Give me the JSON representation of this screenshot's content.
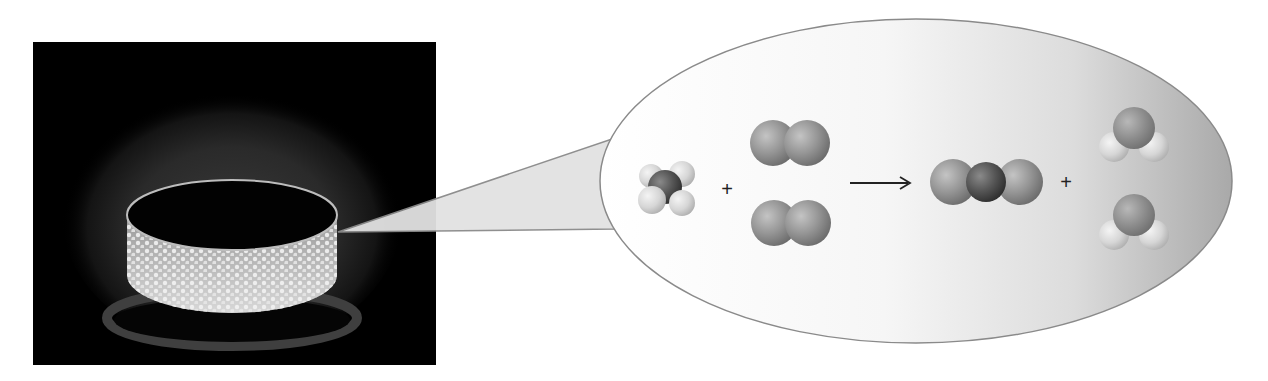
{
  "figure": {
    "photo": {
      "subject": "gas-stove-burner-flame",
      "background_color": "#000000"
    },
    "callout": {
      "fill_color": "#e2e2e2",
      "border_color": "#8a8a8a"
    },
    "reaction": {
      "reactants": [
        {
          "name": "methane",
          "formula": "CH4",
          "count": 1
        },
        {
          "name": "oxygen",
          "formula": "O2",
          "count": 2
        }
      ],
      "products": [
        {
          "name": "carbon-dioxide",
          "formula": "CO2",
          "count": 1
        },
        {
          "name": "water",
          "formula": "H2O",
          "count": 2
        }
      ],
      "plus_sign": "+",
      "arrow_symbol": "→"
    },
    "colors": {
      "carbon": "#4a4a4a",
      "oxygen": "#8f8f8f",
      "hydrogen": "#d9d9d9",
      "ellipse_light": "#ffffff",
      "ellipse_dark": "#b5b5b5"
    }
  }
}
